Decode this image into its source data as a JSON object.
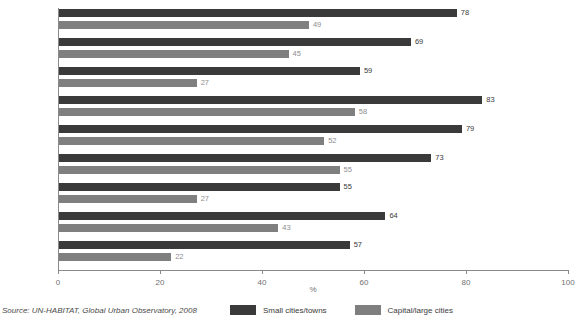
{
  "chart_data": {
    "type": "bar",
    "orientation": "horizontal",
    "title": "",
    "xlabel": "%",
    "ylabel": "",
    "xlim": [
      0,
      100
    ],
    "xticks": [
      0,
      20,
      40,
      60,
      80,
      100
    ],
    "xticklabels": [
      "0",
      "20",
      "40",
      "60",
      "80",
      "100"
    ],
    "grid": false,
    "legend_position": "bottom-center",
    "categories": [
      "Benin",
      "Cote d'Ivoire",
      "Gabon",
      "Mozambique",
      "Rwanda",
      "Senegal",
      "Guatemala",
      "Nicaragua",
      "Nepal"
    ],
    "series": [
      {
        "name": "Small cities/towns",
        "color": "#3a3a3a",
        "values": [
          78,
          69,
          59,
          83,
          79,
          73,
          55,
          64,
          57
        ]
      },
      {
        "name": "Capital/large cities",
        "color": "#7f7f7f",
        "values": [
          49,
          45,
          27,
          58,
          52,
          55,
          27,
          43,
          22
        ]
      }
    ]
  },
  "source": {
    "note": "Source: UN-HABITAT, Global Urban Observatory, 2008"
  }
}
